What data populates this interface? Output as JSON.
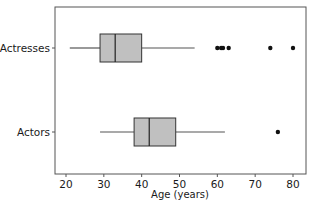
{
  "chart_data": {
    "type": "boxplot",
    "orientation": "horizontal",
    "title": "",
    "xlabel": "Age (years)",
    "ylabel": "",
    "xlim": [
      18,
      84
    ],
    "xticks": [
      20,
      30,
      40,
      50,
      60,
      70,
      80
    ],
    "grid": false,
    "legend": null,
    "categories": [
      "Actresses",
      "Actors"
    ],
    "series": [
      {
        "name": "Actresses",
        "whisker_low": 21,
        "q1": 29,
        "median": 33,
        "q3": 40,
        "whisker_high": 54,
        "outliers": [
          60,
          61,
          61.5,
          63,
          74,
          80
        ]
      },
      {
        "name": "Actors",
        "whisker_low": 29,
        "q1": 38,
        "median": 42,
        "q3": 49,
        "whisker_high": 62,
        "outliers": [
          76
        ]
      }
    ],
    "colors": {
      "box_fill": "#c0c0c0",
      "box_stroke": "#333333",
      "whisker": "#555555",
      "outlier": "#111111",
      "frame": "#555555"
    }
  },
  "labels": {
    "xlabel": "Age (years)",
    "categories": [
      "Actresses",
      "Actors"
    ],
    "ticks": [
      "20",
      "30",
      "40",
      "50",
      "60",
      "70",
      "80"
    ]
  }
}
